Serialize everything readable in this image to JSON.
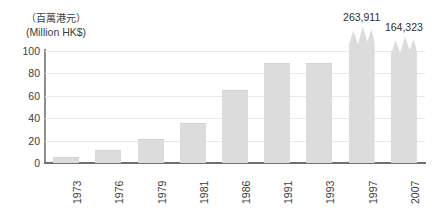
{
  "header": {
    "unit_cjk": "（百萬港元）",
    "unit_en": "(Million HK$)"
  },
  "chart_data": {
    "type": "bar",
    "title": "",
    "subtitle": "",
    "xlabel": "",
    "ylabel": "（百萬港元） (Million HK$)",
    "ylim": [
      0,
      100
    ],
    "yticks": [
      "0",
      "20",
      "40",
      "60",
      "80",
      "100"
    ],
    "ytick_values": [
      0,
      20,
      40,
      60,
      80,
      100
    ],
    "grid": true,
    "legend": "none",
    "axis_break": true,
    "categories": [
      "1973",
      "1976",
      "1979",
      "1981",
      "1986",
      "1991",
      "1993",
      "1997",
      "2007"
    ],
    "values": [
      5,
      12,
      21,
      36,
      65,
      89,
      89,
      263911,
      164323
    ],
    "bars": [
      {
        "category": "1973",
        "value": 5,
        "display_height": 5,
        "broken": false,
        "label": ""
      },
      {
        "category": "1976",
        "value": 12,
        "display_height": 12,
        "broken": false,
        "label": ""
      },
      {
        "category": "1979",
        "value": 21,
        "display_height": 21,
        "broken": false,
        "label": ""
      },
      {
        "category": "1981",
        "value": 36,
        "display_height": 36,
        "broken": false,
        "label": ""
      },
      {
        "category": "1986",
        "value": 65,
        "display_height": 65,
        "broken": false,
        "label": ""
      },
      {
        "category": "1991",
        "value": 89,
        "display_height": 89,
        "broken": false,
        "label": ""
      },
      {
        "category": "1993",
        "value": 89,
        "display_height": 89,
        "broken": false,
        "label": ""
      },
      {
        "category": "1997",
        "value": 263911,
        "display_height": 122,
        "broken": true,
        "label": "263,911"
      },
      {
        "category": "2007",
        "value": 164323,
        "display_height": 113,
        "broken": true,
        "label": "164,323"
      }
    ],
    "colors": {
      "bar_fill": "#dcdcdc",
      "gridline": "#e9e9e9",
      "axis": "#6f6f6f",
      "text": "#3c3c3c",
      "background": "#ffffff"
    }
  }
}
